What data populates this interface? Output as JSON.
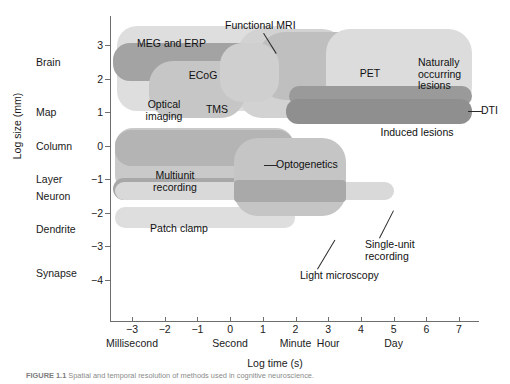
{
  "figure": {
    "caption_label": "FIGURE 1.1",
    "caption_text": "Spatial and temporal resolution of methods used in cognitive neuroscience."
  },
  "chart_data": {
    "type": "scatter",
    "title": "",
    "xlabel": "Log time (s)",
    "ylabel": "Log size (mm)",
    "xlim": [
      -3.6,
      7.5
    ],
    "ylim": [
      -4.4,
      3.4
    ],
    "grid": false,
    "legend": "none",
    "x_ticks": [
      -3,
      -2,
      -1,
      0,
      1,
      2,
      3,
      4,
      5,
      6,
      7
    ],
    "x_tick_labels": [
      "−3",
      "−2",
      "−1",
      "0",
      "1",
      "2",
      "3",
      "4",
      "5",
      "6",
      "7"
    ],
    "x_unit_annotations": [
      {
        "label": "Millisecond",
        "x": -3
      },
      {
        "label": "Second",
        "x": 0
      },
      {
        "label": "Minute",
        "x": 2
      },
      {
        "label": "Hour",
        "x": 3
      },
      {
        "label": "Day",
        "x": 5
      }
    ],
    "y_ticks": [
      3,
      2,
      1,
      0,
      -1,
      -2,
      -3,
      -4
    ],
    "y_tick_labels": [
      "3",
      "2",
      "1",
      "0",
      "−1",
      "−2",
      "−3",
      "−4"
    ],
    "y_category_labels": [
      {
        "label": "Brain",
        "y": 2.5
      },
      {
        "label": "Map",
        "y": 1.0
      },
      {
        "label": "Column",
        "y": 0.0
      },
      {
        "label": "Layer",
        "y": -1.0
      },
      {
        "label": "Neuron",
        "y": -1.5
      },
      {
        "label": "Dendrite",
        "y": -2.5
      },
      {
        "label": "Synapse",
        "y": -3.8
      }
    ],
    "regions": [
      {
        "name": "MEG and ERP",
        "x0": -3.4,
        "x1": 2.1,
        "y0": 0.55,
        "y1": 3.15,
        "label_position": "inside"
      },
      {
        "name": "ECoG",
        "x0": -3.3,
        "x1": 1.2,
        "y0": 1.45,
        "y1": 2.6,
        "label_position": "inside"
      },
      {
        "name": "Optical\nimaging",
        "x0": -2.3,
        "x1": 0.6,
        "y0": 0.15,
        "y1": 1.9,
        "label_position": "inside"
      },
      {
        "name": "TMS",
        "x0": -0.2,
        "x1": 1.5,
        "y0": 0.5,
        "y1": 2.3,
        "label_position": "inside"
      },
      {
        "name": "Functional MRI",
        "x0": 0.3,
        "x1": 3.6,
        "y0": 0.35,
        "y1": 3.05,
        "label_position": "external-top"
      },
      {
        "name": "PET",
        "x0": 0.9,
        "x1": 5.0,
        "y0": 0.9,
        "y1": 2.95,
        "label_position": "inside"
      },
      {
        "name": "Naturally\noccurring\nlesions",
        "x0": 3.0,
        "x1": 7.2,
        "y0": 0.45,
        "y1": 2.95,
        "label_position": "inside"
      },
      {
        "name": "DTI",
        "x0": 2.0,
        "x1": 7.0,
        "y0": 0.75,
        "y1": 1.35,
        "label_position": "external-right"
      },
      {
        "name": "Induced lesions",
        "x0": 2.0,
        "x1": 7.0,
        "y0": 0.2,
        "y1": 0.95,
        "label_position": "inside"
      },
      {
        "name": "Multiunit\nrecording",
        "x0": -3.4,
        "x1": 2.0,
        "y0": -1.85,
        "y1": 0.1,
        "label_position": "inside"
      },
      {
        "name": "Optogenetics",
        "x0": -3.5,
        "x1": 2.2,
        "y0": -1.55,
        "y1": -0.85,
        "label_position": "external-right"
      },
      {
        "name": "Patch clamp",
        "x0": -3.4,
        "x1": 2.1,
        "y0": -2.65,
        "y1": -2.05,
        "label_position": "inside"
      },
      {
        "name": "Light microscopy",
        "x0": 0.3,
        "x1": 3.7,
        "y0": -2.75,
        "y1": -0.55,
        "label_position": "external-bottom"
      },
      {
        "name": "Single-unit recording",
        "x0": -3.4,
        "x1": 5.3,
        "y0": -1.75,
        "y1": -1.25,
        "label_position": "external-bottom-right"
      }
    ]
  },
  "colors": {
    "light_gray": "#dcdcdc",
    "mid_gray": "#c3c3c3",
    "medium_gray": "#b1b1b1",
    "dark_gray": "#9b9b9b",
    "darker_gray": "#8e8e8e",
    "axis": "#6e6e6e",
    "text": "#1a1a1a"
  },
  "labels": {
    "meg_erp": "MEG and ERP",
    "ecog": "ECoG",
    "optical_imaging": "Optical\nimaging",
    "tms": "TMS",
    "functional_mri": "Functional MRI",
    "pet": "PET",
    "naturally_occurring_lesions": "Naturally\noccurring\nlesions",
    "dti": "DTI",
    "induced_lesions": "Induced lesions",
    "multiunit_recording": "Multiunit\nrecording",
    "optogenetics": "Optogenetics",
    "patch_clamp": "Patch clamp",
    "light_microscopy": "Light microscopy",
    "single_unit_recording": "Single-unit\nrecording"
  }
}
